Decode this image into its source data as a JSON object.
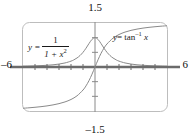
{
  "figure": {
    "kind": "graphing-calculator-plot",
    "frame": {
      "rounded": true,
      "border_color": "#b9b9b9"
    },
    "background": "#ffffff"
  },
  "axes": {
    "x_left_label": "–6",
    "x_right_label": "6",
    "y_top_label": "1.5",
    "y_bottom_label": "–1.5",
    "axis_color": "#6b6b6b",
    "x_ticks": [
      -5,
      -4,
      -3,
      -2,
      -1,
      1,
      2,
      3,
      4,
      5
    ],
    "y_ticks": [
      -1.0,
      -0.5,
      0.5,
      1.0
    ]
  },
  "labels": {
    "fn1": {
      "lhs": "y =",
      "numerator": "1",
      "denominator_base": "1 + x",
      "denominator_exp": "2",
      "plain": "y = 1/(1 + x²)"
    },
    "fn2": {
      "text_y": "y",
      "text_eq": "= tan",
      "text_exp": "–1",
      "text_x": "x",
      "plain": "y = tan⁻¹ x"
    }
  },
  "chart_data": {
    "type": "line",
    "title": "",
    "xlabel": "",
    "ylabel": "",
    "xlim": [
      -6,
      6
    ],
    "ylim": [
      -1.5,
      1.5
    ],
    "grid": false,
    "legend": "inline-annotations",
    "series": [
      {
        "name": "y = 1/(1 + x^2)",
        "color": "#8a8a8a",
        "x": [
          -6,
          -5.5,
          -5,
          -4.5,
          -4,
          -3.5,
          -3,
          -2.5,
          -2,
          -1.75,
          -1.5,
          -1.25,
          -1,
          -0.75,
          -0.5,
          -0.25,
          0,
          0.25,
          0.5,
          0.75,
          1,
          1.25,
          1.5,
          1.75,
          2,
          2.5,
          3,
          3.5,
          4,
          4.5,
          5,
          5.5,
          6
        ],
        "y": [
          0.027,
          0.032,
          0.038,
          0.047,
          0.059,
          0.075,
          0.1,
          0.138,
          0.2,
          0.246,
          0.308,
          0.39,
          0.5,
          0.64,
          0.8,
          0.941,
          1.0,
          0.941,
          0.8,
          0.64,
          0.5,
          0.39,
          0.308,
          0.246,
          0.2,
          0.138,
          0.1,
          0.075,
          0.059,
          0.047,
          0.038,
          0.032,
          0.027
        ]
      },
      {
        "name": "y = tan^-1 x",
        "color": "#8a8a8a",
        "x": [
          -6,
          -5.5,
          -5,
          -4.5,
          -4,
          -3.5,
          -3,
          -2.5,
          -2,
          -1.5,
          -1,
          -0.75,
          -0.5,
          -0.25,
          0,
          0.25,
          0.5,
          0.75,
          1,
          1.5,
          2,
          2.5,
          3,
          3.5,
          4,
          4.5,
          5,
          5.5,
          6
        ],
        "y": [
          -1.406,
          -1.391,
          -1.373,
          -1.352,
          -1.326,
          -1.292,
          -1.249,
          -1.19,
          -1.107,
          -0.983,
          -0.785,
          -0.644,
          -0.464,
          -0.245,
          0,
          0.245,
          0.464,
          0.644,
          0.785,
          0.983,
          1.107,
          1.19,
          1.249,
          1.292,
          1.326,
          1.352,
          1.373,
          1.391,
          1.406
        ]
      }
    ]
  }
}
